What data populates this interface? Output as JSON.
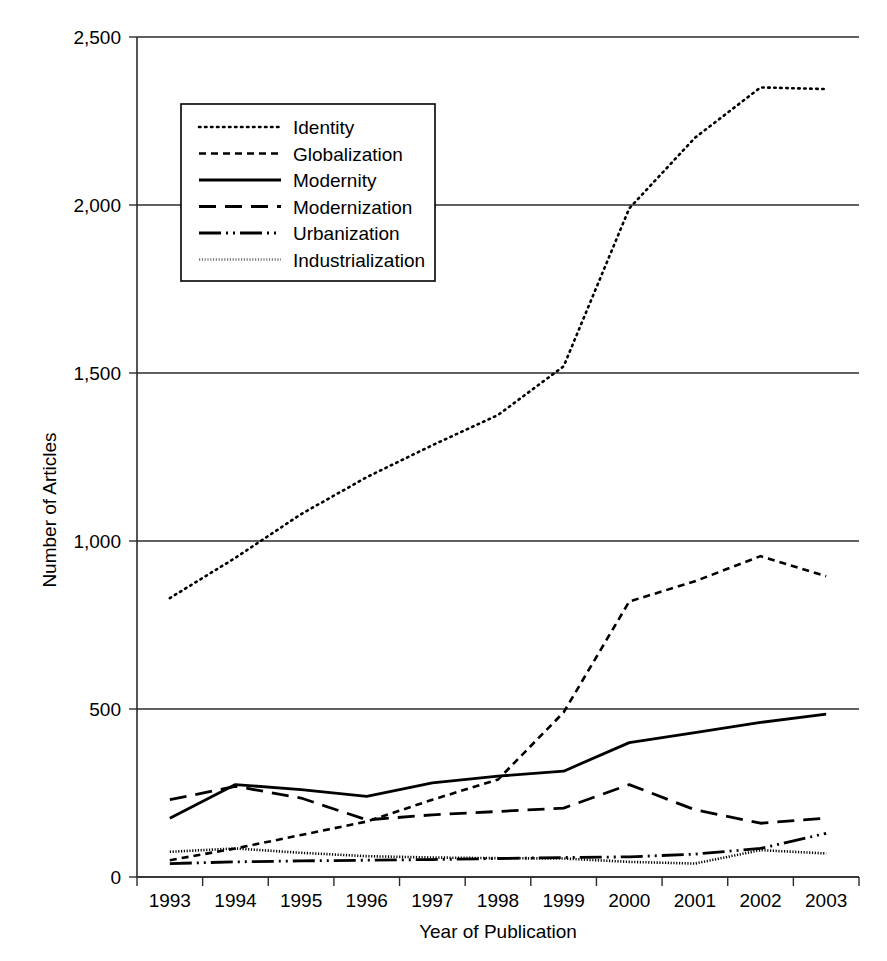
{
  "chart_data": {
    "type": "line",
    "title": "",
    "xlabel": "Year of Publication",
    "ylabel": "Number of Articles",
    "categories": [
      "1993",
      "1994",
      "1995",
      "1996",
      "1997",
      "1998",
      "1999",
      "2000",
      "2001",
      "2002",
      "2003"
    ],
    "x": [
      1993,
      1994,
      1995,
      1996,
      1997,
      1998,
      1999,
      2000,
      2001,
      2002,
      2003
    ],
    "xlim": [
      1993,
      2003
    ],
    "ylim": [
      0,
      2500
    ],
    "yticks": [
      0,
      500,
      1000,
      1500,
      2000,
      2500
    ],
    "ytick_labels": [
      "0",
      "500",
      "1,000",
      "1,500",
      "2,000",
      "2,500"
    ],
    "grid": "horizontal",
    "legend_position": "upper-left-inside",
    "series": [
      {
        "name": "Identity",
        "style": "dotted",
        "values": [
          830,
          950,
          1080,
          1190,
          1285,
          1375,
          1520,
          1990,
          2200,
          2350,
          2345
        ]
      },
      {
        "name": "Globalization",
        "style": "short-dashed",
        "values": [
          50,
          85,
          125,
          165,
          230,
          290,
          490,
          820,
          880,
          955,
          895
        ]
      },
      {
        "name": "Modernity",
        "style": "solid",
        "values": [
          175,
          275,
          260,
          240,
          280,
          300,
          315,
          400,
          430,
          460,
          485
        ]
      },
      {
        "name": "Modernization",
        "style": "long-dashed",
        "values": [
          230,
          270,
          235,
          170,
          185,
          195,
          205,
          275,
          200,
          160,
          175
        ]
      },
      {
        "name": "Urbanization",
        "style": "dash-dot-dot",
        "values": [
          40,
          45,
          48,
          50,
          52,
          55,
          58,
          60,
          68,
          85,
          130
        ]
      },
      {
        "name": "Industrialization",
        "style": "fine-dotted-gray",
        "values": [
          75,
          85,
          72,
          62,
          58,
          56,
          55,
          45,
          40,
          80,
          70
        ]
      }
    ]
  },
  "legend": {
    "items": [
      {
        "label": "Identity"
      },
      {
        "label": "Globalization"
      },
      {
        "label": "Modernity"
      },
      {
        "label": "Modernization"
      },
      {
        "label": "Urbanization"
      },
      {
        "label": "Industrialization"
      }
    ]
  },
  "colors": {
    "ink": "#000000",
    "axis": "#2b2b2b",
    "industrialization": "#777777",
    "background": "#ffffff"
  }
}
